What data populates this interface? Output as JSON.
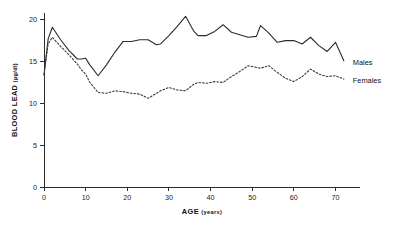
{
  "chart_data": {
    "type": "line",
    "title": "",
    "xlabel": "AGE (years)",
    "ylabel": "BLOOD LEAD (µg/dl)",
    "ylabel_main": "BLOOD LEAD",
    "ylabel_units": "(µg/dl)",
    "xlim": [
      0,
      73
    ],
    "ylim": [
      0,
      20.8
    ],
    "xticks": [
      0,
      10,
      20,
      30,
      40,
      50,
      60,
      70
    ],
    "xtick_labels": [
      "0",
      "10",
      "20",
      "30",
      "40",
      "50",
      "60",
      "70"
    ],
    "yticks": [
      0,
      5,
      10,
      15,
      20
    ],
    "ytick_labels": [
      "0",
      "5",
      "10",
      "15",
      "20"
    ],
    "grid": false,
    "legend_position": "right-inline",
    "line_color": "#2b2b2b",
    "series": [
      {
        "name": "Males",
        "style": "solid",
        "x": [
          0,
          1,
          2,
          4,
          6,
          8,
          9,
          10,
          11,
          13,
          15,
          17,
          19,
          21,
          23,
          25,
          27,
          28,
          30,
          32,
          34,
          36,
          37,
          39,
          41,
          43,
          45,
          47,
          49,
          51,
          52,
          54,
          56,
          58,
          60,
          62,
          64,
          66,
          68,
          70,
          72
        ],
        "y": [
          13.4,
          17.7,
          19.1,
          17.6,
          16.3,
          15.3,
          15.3,
          15.4,
          14.6,
          13.3,
          14.6,
          16.1,
          17.4,
          17.4,
          17.6,
          17.6,
          17.0,
          17.1,
          18.1,
          19.2,
          20.4,
          18.6,
          18.1,
          18.1,
          18.6,
          19.4,
          18.5,
          18.2,
          17.9,
          18.0,
          19.3,
          18.4,
          17.3,
          17.5,
          17.5,
          17.1,
          17.9,
          16.9,
          16.2,
          17.3,
          15.1
        ]
      },
      {
        "name": "Females",
        "style": "dashed",
        "x": [
          0,
          1,
          2,
          4,
          6,
          8,
          9,
          10,
          11,
          13,
          15,
          17,
          19,
          21,
          23,
          25,
          27,
          28,
          30,
          32,
          34,
          36,
          37,
          39,
          41,
          43,
          45,
          47,
          49,
          51,
          52,
          54,
          56,
          58,
          60,
          62,
          64,
          66,
          68,
          70,
          72
        ],
        "y": [
          13.4,
          17.1,
          17.9,
          16.8,
          15.8,
          14.7,
          14.0,
          13.5,
          12.5,
          11.3,
          11.2,
          11.5,
          11.4,
          11.2,
          11.1,
          10.6,
          11.2,
          11.5,
          11.9,
          11.6,
          11.5,
          12.3,
          12.5,
          12.4,
          12.6,
          12.5,
          13.2,
          13.8,
          14.5,
          14.3,
          14.2,
          14.5,
          13.7,
          13.0,
          12.6,
          13.2,
          14.1,
          13.5,
          13.2,
          13.3,
          12.9
        ]
      }
    ],
    "annotations": [
      {
        "text": "Males",
        "x": 73.2,
        "y": 14.9
      },
      {
        "text": "Females",
        "x": 73.2,
        "y": 12.8
      }
    ]
  }
}
